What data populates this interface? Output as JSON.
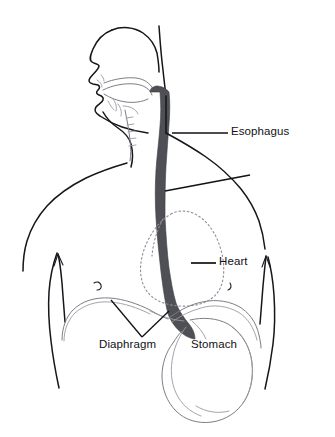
{
  "figure": {
    "background_color": "#ffffff",
    "line_color": "#15151a",
    "organ_line_color": "#7d7d86",
    "esophagus_color": "#4f4f56",
    "label_color": "#111116"
  },
  "labels": [
    {
      "id": "esophagus",
      "text": "Esophagus",
      "leader": "horizontal-plus-diagonal",
      "points_to": "esophagus-tube"
    },
    {
      "id": "heart",
      "text": "Heart",
      "leader": "horizontal",
      "points_to": "heart-outline"
    },
    {
      "id": "diaphragm",
      "text": "Diaphragm",
      "leader": "v-shaped",
      "points_to": "diaphragm-domes"
    },
    {
      "id": "stomach",
      "text": "Stomach",
      "leader": "none",
      "points_to": "stomach-outline"
    }
  ],
  "structures": {
    "head": "left-facing profile with nose, lips, chin, jaw",
    "oral_cavity": "tongue and soft palate curves leading to pharynx",
    "esophagus": "dark vertical tube from pharynx to stomach",
    "heart": "dotted pear-shaped outline in left chest",
    "diaphragm": "two dome curves across lower chest",
    "stomach": "J-shaped outline below the diaphragm",
    "torso": "shoulders, chest with nipples, upper arms"
  }
}
